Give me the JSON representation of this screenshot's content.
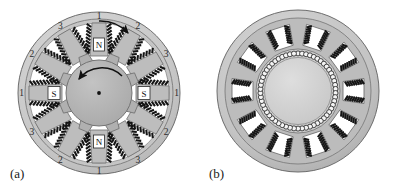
{
  "figure": {
    "panels": [
      {
        "id": "panel-a",
        "caption": "(a)",
        "description": "switched-reluctance-motor-cross-section",
        "stator": {
          "teeth_count": 12,
          "phase_labels": [
            "1",
            "2",
            "3",
            "1",
            "2",
            "3",
            "1",
            "2",
            "3",
            "1",
            "2",
            "3"
          ],
          "pole_markers": [
            {
              "label": "N",
              "position": "top"
            },
            {
              "label": "S",
              "position": "right"
            },
            {
              "label": "N",
              "position": "bottom"
            },
            {
              "label": "S",
              "position": "left"
            }
          ],
          "outer_ring_color": "#c9c9c9",
          "body_color": "#bdbdbd",
          "slot_color": "#ffffff",
          "winding_color": "#151515"
        },
        "rotor": {
          "teeth_count": 8,
          "color": "#b0b0b0",
          "hub_dot_color": "#111111"
        },
        "rotation_arrow": {
          "direction": "counterclockwise",
          "name": "rotor-rotation-arrow"
        },
        "excitation_arrow": {
          "direction": "clockwise",
          "name": "phase-excitation-arrow"
        }
      },
      {
        "id": "panel-b",
        "caption": "(b)",
        "description": "wound-rotor-motor-cross-section",
        "stator": {
          "teeth_count": 10,
          "outer_ring_color": "#c9c9c9",
          "body_color": "#b8b8b8",
          "slot_color": "#ffffff",
          "winding_color": "#151515"
        },
        "rotor": {
          "core_color": "#d2d2d2",
          "conductor_count": 58,
          "conductor_fill": "#f4f4f4",
          "conductor_stroke": "#2a2a2a"
        }
      }
    ],
    "colors": {
      "background": "#ffffff",
      "outline": "#6b6b6b",
      "ink": "#1a1a1a"
    }
  }
}
